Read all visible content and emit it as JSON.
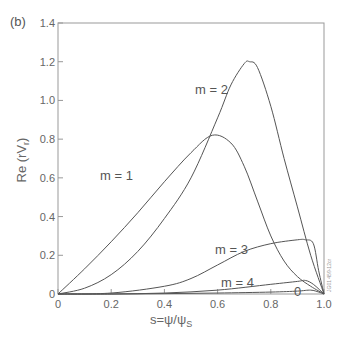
{
  "panel_label": "(b)",
  "xaxis": {
    "title": "s=ψ/ψ",
    "title_sub": "S",
    "ticks": [
      "0",
      "0.2",
      "0.4",
      "0.6",
      "0.8",
      "1.0"
    ]
  },
  "yaxis": {
    "title": "Re (rV",
    "title_sub": "r",
    "title_end": ")",
    "ticks": [
      "0",
      "0.2",
      "0.4",
      "0.6",
      "0.8",
      "1.0",
      "1.2",
      "1.4"
    ]
  },
  "curve_labels": {
    "m0": "0",
    "m1": "m = 1",
    "m2": "m = 2",
    "m3": "m = 3",
    "m4": "m = 4"
  },
  "figure_id": "JG01 459-12cr",
  "colors": {
    "curve": "#555555",
    "axis": "#999999"
  },
  "chart_data": {
    "type": "line",
    "title": "",
    "panel": "(b)",
    "xlabel": "s=ψ/ψS",
    "ylabel": "Re (rVr)",
    "xlim": [
      0,
      1.0
    ],
    "ylim": [
      0,
      1.4
    ],
    "grid": false,
    "legend": "inline curve labels",
    "series": [
      {
        "name": "m = 0",
        "x": [
          0,
          0.2,
          0.4,
          0.6,
          0.8,
          0.9,
          0.95,
          0.98,
          1.0
        ],
        "y": [
          0,
          0.0,
          0.002,
          0.005,
          0.01,
          0.015,
          0.02,
          0.01,
          0
        ]
      },
      {
        "name": "m = 1",
        "x": [
          0,
          0.1,
          0.2,
          0.3,
          0.4,
          0.5,
          0.58,
          0.65,
          0.7,
          0.75,
          0.8,
          0.85,
          0.9,
          0.95,
          1.0
        ],
        "y": [
          0,
          0.13,
          0.27,
          0.42,
          0.58,
          0.73,
          0.82,
          0.78,
          0.66,
          0.48,
          0.3,
          0.17,
          0.09,
          0.04,
          0
        ]
      },
      {
        "name": "m = 2",
        "x": [
          0,
          0.1,
          0.2,
          0.3,
          0.4,
          0.5,
          0.6,
          0.65,
          0.7,
          0.72,
          0.75,
          0.8,
          0.85,
          0.9,
          0.95,
          1.0
        ],
        "y": [
          0,
          0.03,
          0.1,
          0.22,
          0.39,
          0.6,
          0.91,
          1.08,
          1.19,
          1.2,
          1.17,
          0.97,
          0.7,
          0.45,
          0.2,
          0
        ]
      },
      {
        "name": "m = 3",
        "x": [
          0,
          0.2,
          0.4,
          0.5,
          0.6,
          0.7,
          0.8,
          0.9,
          0.93,
          0.96,
          0.98,
          1.0
        ],
        "y": [
          0,
          0.005,
          0.04,
          0.08,
          0.15,
          0.22,
          0.26,
          0.28,
          0.28,
          0.26,
          0.12,
          0
        ]
      },
      {
        "name": "m = 4",
        "x": [
          0,
          0.2,
          0.4,
          0.6,
          0.8,
          0.9,
          0.93,
          0.96,
          1.0
        ],
        "y": [
          0,
          0.0,
          0.005,
          0.02,
          0.05,
          0.065,
          0.07,
          0.05,
          0
        ]
      }
    ]
  }
}
